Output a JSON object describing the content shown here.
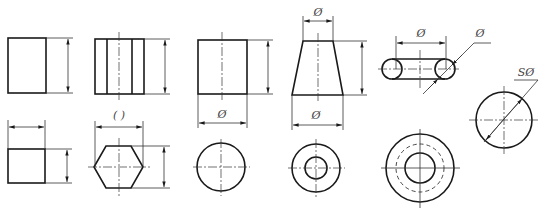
{
  "diagram": {
    "labels": {
      "cylinder_dia": "Ø",
      "frustum_top_dia": "Ø",
      "frustum_bottom_dia": "Ø",
      "torus_center_dia": "Ø",
      "torus_tube_dia": "Ø",
      "sphere_dia": "SØ",
      "prism_ref": "( )"
    },
    "colors": {
      "line": "#1a1a1a",
      "thin": "#333333",
      "text": "#444444",
      "background": "#ffffff"
    },
    "shapes": [
      "rectangular-prism-front",
      "rectangular-prism-top",
      "hexagonal-prism-front",
      "hexagonal-prism-top",
      "cylinder-front",
      "cylinder-top",
      "frustum-front",
      "frustum-top",
      "torus-front",
      "torus-top",
      "sphere"
    ]
  }
}
